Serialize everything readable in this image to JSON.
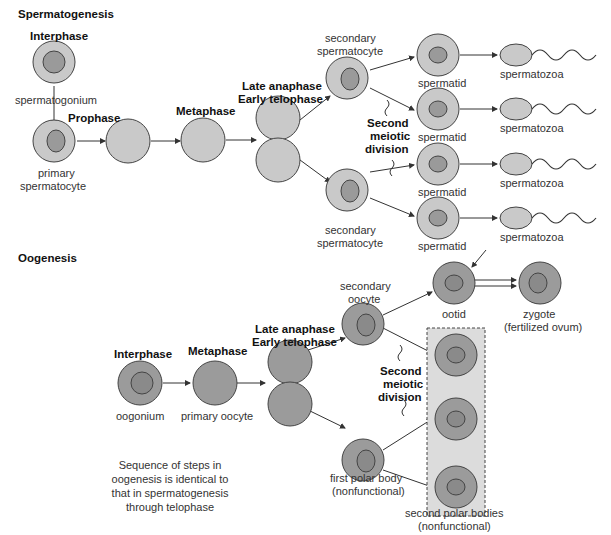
{
  "spermatogenesis": {
    "title": "Spermatogenesis",
    "interphase": "Interphase",
    "spermatogonium": "spermatogonium",
    "prophase": "Prophase",
    "primary1": "primary",
    "primary2": "spermatocyte",
    "metaphase": "Metaphase",
    "late_anaphase": "Late anaphase",
    "early_telophase": "Early telophase",
    "secondary_top1": "secondary",
    "secondary_top2": "spermatocyte",
    "secondary_bot1": "secondary",
    "secondary_bot2": "spermatocyte",
    "second1": "Second",
    "second2": "meiotic",
    "second3": "division",
    "spermatid": [
      "spermatid",
      "spermatid",
      "spermatid",
      "spermatid"
    ],
    "spermatozoa": [
      "spermatozoa",
      "spermatozoa",
      "spermatozoa",
      "spermatozoa"
    ]
  },
  "oogenesis": {
    "title": "Oogenesis",
    "interphase": "Interphase",
    "oogonium": "oogonium",
    "metaphase": "Metaphase",
    "primary_oocyte": "primary oocyte",
    "late_anaphase": "Late anaphase",
    "early_telophase": "Early telophase",
    "secondary1": "secondary",
    "secondary2": "oocyte",
    "ootid": "ootid",
    "zygote1": "zygote",
    "zygote2": "(fertilized ovum)",
    "second1": "Second",
    "second2": "meiotic",
    "second3": "division",
    "first_polar1": "first polar body",
    "first_polar2": "(nonfunctional)",
    "second_polar1": "second polar bodies",
    "second_polar2": "(nonfunctional)",
    "note": [
      "Sequence of steps in",
      "oogenesis is identical to",
      "that in spermatogenesis",
      "through telophase"
    ]
  },
  "colors": {
    "sperm_cell": "#c9c9c9",
    "oo_cell": "#9b9b9b",
    "box": "#dcdcdc"
  }
}
